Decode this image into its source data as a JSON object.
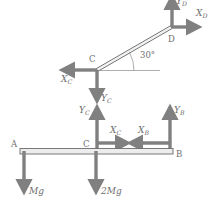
{
  "figure": {
    "type": "free-body-diagram",
    "title": "",
    "stroke_color": "#808080",
    "member_fill_color": "#e8e8e8",
    "member_outline_color": "#555555",
    "text_color": "#6e6e6e",
    "background_color": "#ffffff"
  },
  "members": {
    "rod_CD": {
      "label": "rod C-D",
      "start_point": "C",
      "end_point": "D",
      "angle_label": "30°",
      "angle_value": 30
    },
    "beam_AB": {
      "label": "beam A-B",
      "start_point": "A",
      "end_point": "B",
      "interior_point": "C"
    }
  },
  "points": {
    "A": "A",
    "B": "B",
    "C_rod": "C",
    "C_beam": "C",
    "D": "D"
  },
  "forces": {
    "rod": [
      {
        "name": "YD",
        "label_main": "Y",
        "label_sub": "D",
        "direction": "up",
        "at": "D"
      },
      {
        "name": "XD",
        "label_main": "X",
        "label_sub": "D",
        "direction": "right",
        "at": "D"
      },
      {
        "name": "XC_rod",
        "label_main": "X",
        "label_sub": "C",
        "direction": "left",
        "at": "C"
      },
      {
        "name": "YC_rod",
        "label_main": "Y",
        "label_sub": "C",
        "direction": "down",
        "at": "C"
      }
    ],
    "beam": [
      {
        "name": "YC_beam",
        "label_main": "Y",
        "label_sub": "C",
        "direction": "up",
        "at": "C"
      },
      {
        "name": "XC_beam",
        "label_main": "X",
        "label_sub": "C",
        "direction": "right",
        "at": "C"
      },
      {
        "name": "XB",
        "label_main": "X",
        "label_sub": "B",
        "direction": "left",
        "at": "B"
      },
      {
        "name": "YB",
        "label_main": "Y",
        "label_sub": "B",
        "direction": "up",
        "at": "B"
      },
      {
        "name": "Mg",
        "label_main": "Mg",
        "label_sub": "",
        "direction": "down",
        "at": "A"
      },
      {
        "name": "2Mg",
        "label_main": "2Mg",
        "label_sub": "",
        "direction": "down",
        "at": "C"
      }
    ]
  },
  "labels": {
    "YD": "Y",
    "YD_sub": "D",
    "XD": "X",
    "XD_sub": "D",
    "XC_rod": "X",
    "XC_rod_sub": "C",
    "YC_rod": "Y",
    "YC_rod_sub": "C",
    "YC_beam": "Y",
    "YC_beam_sub": "C",
    "XC_beam": "X",
    "XC_beam_sub": "C",
    "XB": "X",
    "XB_sub": "B",
    "YB": "Y",
    "YB_sub": "B",
    "weight_Mg": "Mg",
    "weight_2Mg": "2Mg",
    "angle": "30°",
    "point_A": "A",
    "point_B": "B",
    "point_C_rod": "C",
    "point_C_beam": "C",
    "point_D": "D"
  }
}
